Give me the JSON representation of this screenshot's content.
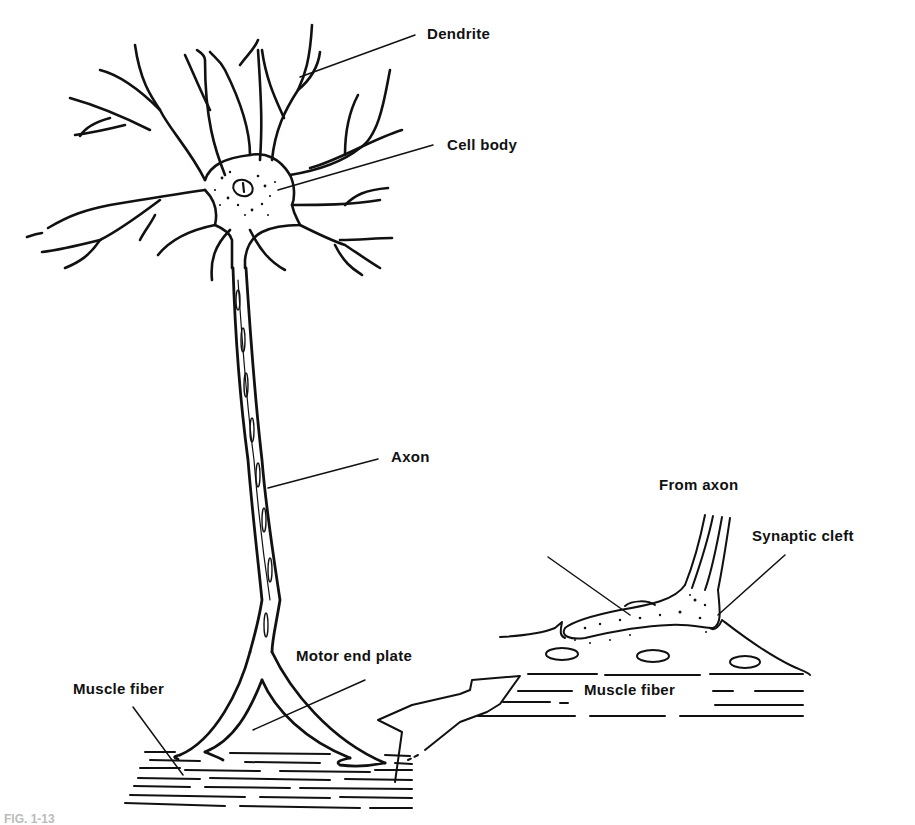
{
  "figure": {
    "type": "neuron-motor-end-plate-diagram",
    "caption_partial": "FIG. 1-13",
    "labels": {
      "dendrite": "Dendrite",
      "cell_body": "Cell body",
      "axon": "Axon",
      "motor_end_plate": "Motor end plate",
      "muscle_fiber_left": "Muscle fiber",
      "from_axon": "From axon",
      "synaptic_cleft": "Synaptic cleft",
      "muscle_fiber_right": "Muscle fiber"
    },
    "colors": {
      "ink": "#111111",
      "background": "#ffffff"
    }
  }
}
